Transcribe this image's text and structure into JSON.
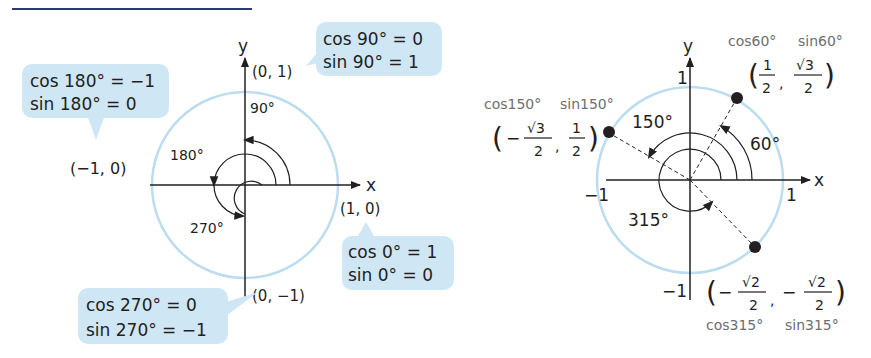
{
  "title": {
    "text": "",
    "underline_color": "#2a3a78"
  },
  "colors": {
    "callout_bg": "#cfe6f5",
    "unit_circle": "#bcdcef",
    "ink": "#231f20",
    "gray_label": "#6d6e71"
  },
  "left_diagram": {
    "axis_x_label": "x",
    "axis_y_label": "y",
    "points": {
      "p0": "(1, 0)",
      "p90": "(0, 1)",
      "p180": "(−1, 0)",
      "p270": "(0, −1)"
    },
    "angles": {
      "a90": "90°",
      "a180": "180°",
      "a270": "270°"
    },
    "callouts": {
      "c180": {
        "line1": "cos 180° = −1",
        "line2": "sin 180° = 0"
      },
      "c90": {
        "line1": "cos 90° = 0",
        "line2": "sin 90° = 1"
      },
      "c0": {
        "line1": "cos 0° = 1",
        "line2": "sin 0° = 0"
      },
      "c270": {
        "line1": "cos 270° = 0",
        "line2": "sin 270° = −1"
      }
    }
  },
  "right_diagram": {
    "axis_x_label": "x",
    "axis_y_label": "y",
    "ticks": {
      "pos_x": "1",
      "neg_x": "−1",
      "pos_y": "1",
      "neg_y": "−1"
    },
    "angles": {
      "a60": "60°",
      "a150": "150°",
      "a315": "315°"
    },
    "point60": {
      "caption_cos": "cos60°",
      "caption_sin": "sin60°",
      "x_num": "1",
      "x_den": "2",
      "y_num": "√3",
      "y_den": "2"
    },
    "point150": {
      "caption_cos": "cos150°",
      "caption_sin": "sin150°",
      "x_sign": "−",
      "x_num": "√3",
      "x_den": "2",
      "y_num": "1",
      "y_den": "2"
    },
    "point315": {
      "caption_cos": "cos315°",
      "caption_sin": "sin315°",
      "x_sign": "−",
      "x_num": "√2",
      "x_den": "2",
      "y_sign": "−",
      "y_num": "√2",
      "y_den": "2"
    }
  }
}
